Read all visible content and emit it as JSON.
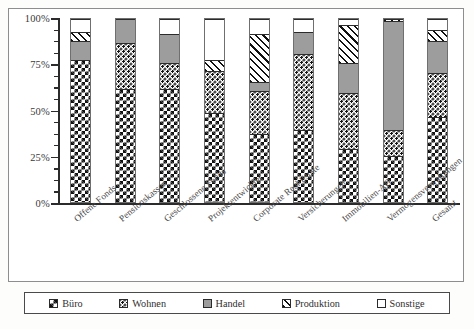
{
  "chart_data": {
    "type": "bar",
    "subtype": "stacked-100-percent",
    "title": "",
    "xlabel": "",
    "ylabel": "",
    "ylim": [
      0,
      100
    ],
    "ytick_labels": [
      "0%",
      "25%",
      "50%",
      "75%",
      "100%"
    ],
    "ytick_values": [
      0,
      25,
      50,
      75,
      100
    ],
    "yminor_step": 6.25,
    "grid": false,
    "legend_position": "bottom",
    "categories": [
      "Offene Fonds",
      "Pensionskassen",
      "Geschlossene Fonds",
      "Projektentwickler",
      "Corporate Real Estate",
      "Versicherungen",
      "Immobilien-AG",
      "Vermögensverwaltungen",
      "Gesamt"
    ],
    "series": [
      {
        "name": "Büro",
        "pattern": "checkerboard",
        "values": [
          78,
          62,
          62,
          49,
          38,
          40,
          30,
          26,
          47
        ]
      },
      {
        "name": "Wohnen",
        "pattern": "speckled-dots",
        "values": [
          0,
          25,
          14,
          23,
          23,
          41,
          30,
          14,
          24
        ]
      },
      {
        "name": "Handel",
        "pattern": "solid-gray",
        "values": [
          10,
          13,
          16,
          0,
          5,
          12,
          16,
          59,
          17
        ]
      },
      {
        "name": "Produktion",
        "pattern": "diagonal-hatch",
        "values": [
          5,
          0,
          0,
          6,
          26,
          0,
          21,
          1,
          6
        ]
      },
      {
        "name": "Sonstige",
        "pattern": "white",
        "values": [
          7,
          0,
          8,
          22,
          8,
          7,
          3,
          0,
          6
        ]
      }
    ]
  },
  "legend": {
    "items": [
      {
        "label": "Büro",
        "pattern": "checkerboard"
      },
      {
        "label": "Wohnen",
        "pattern": "speckled-dots"
      },
      {
        "label": "Handel",
        "pattern": "solid-gray"
      },
      {
        "label": "Produktion",
        "pattern": "diagonal-hatch"
      },
      {
        "label": "Sonstige",
        "pattern": "white"
      }
    ]
  },
  "colors": {
    "handel_gray": "#9d9d9d",
    "ink": "#2b2b2b",
    "frame": "#8e8e8e",
    "background": "#ffffff"
  }
}
